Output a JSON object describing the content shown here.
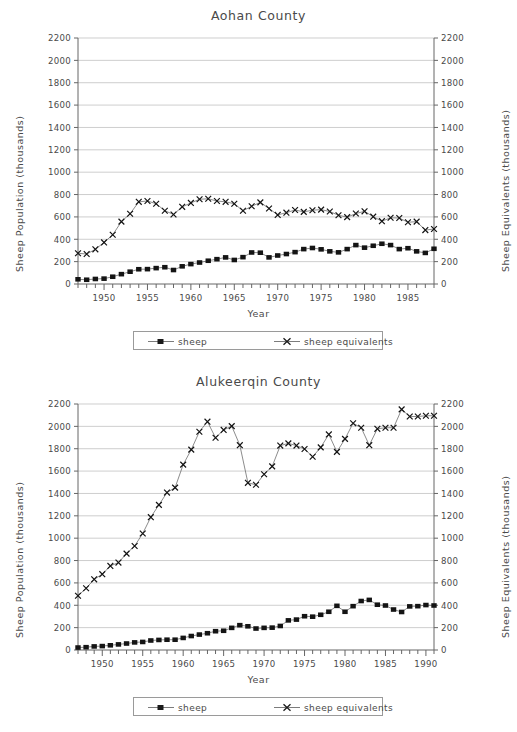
{
  "figure": {
    "xlabel": "Year",
    "ylabel_left": "Sheep Population (thousands)",
    "ylabel_right": "Sheep Equivalents (thousands)",
    "legend": [
      {
        "label": "sheep",
        "marker": "square",
        "color": "#1a1a1a"
      },
      {
        "label": "sheep equivalents",
        "marker": "cross",
        "color": "#1a1a1a"
      }
    ],
    "axis_color": "#666666",
    "grid_color": "#b9b9b9",
    "text_color": "#4a4a4a"
  },
  "chart_data": [
    {
      "type": "line",
      "title": "Aohan County",
      "xlabel": "Year",
      "ylabel": "Sheep Population (thousands)",
      "ylabel_right": "Sheep Equivalents (thousands)",
      "ylim": [
        0,
        2200
      ],
      "yticks": [
        0,
        200,
        400,
        600,
        800,
        1000,
        1200,
        1400,
        1600,
        1800,
        2000,
        2200
      ],
      "ytick_labels": [
        "0",
        "200",
        "400",
        "600",
        "800",
        "1000",
        "1200",
        "1400",
        "1600",
        "1800",
        "2000",
        "2200"
      ],
      "yticks_right": [
        0,
        200,
        400,
        600,
        800,
        1000,
        1200,
        1400,
        1600,
        1800,
        2000,
        2200
      ],
      "ytick_labels_right": [
        "0",
        "200",
        "400",
        "600",
        "800",
        "1000",
        "1200",
        "1400",
        "1600",
        "1800",
        "2000",
        "2200"
      ],
      "xlim": [
        1947,
        1988
      ],
      "xticks": [
        1950,
        1955,
        1960,
        1965,
        1970,
        1975,
        1980,
        1985
      ],
      "xtick_labels": [
        "1950",
        "1955",
        "1960",
        "1965",
        "1970",
        "1975",
        "1980",
        "1985"
      ],
      "x": [
        1947,
        1948,
        1949,
        1950,
        1951,
        1952,
        1953,
        1954,
        1955,
        1956,
        1957,
        1958,
        1959,
        1960,
        1961,
        1962,
        1963,
        1964,
        1965,
        1966,
        1967,
        1968,
        1969,
        1970,
        1971,
        1972,
        1973,
        1974,
        1975,
        1976,
        1977,
        1978,
        1979,
        1980,
        1981,
        1982,
        1983,
        1984,
        1985,
        1986,
        1987,
        1988
      ],
      "grid": true,
      "legend_position": "below",
      "series": [
        {
          "name": "sheep",
          "marker": "square",
          "values": [
            42,
            38,
            45,
            48,
            65,
            88,
            110,
            132,
            133,
            142,
            150,
            125,
            158,
            178,
            192,
            208,
            222,
            238,
            215,
            240,
            282,
            280,
            238,
            255,
            268,
            285,
            312,
            322,
            310,
            292,
            283,
            312,
            348,
            325,
            342,
            360,
            348,
            312,
            320,
            292,
            278,
            315
          ]
        },
        {
          "name": "sheep equivalents",
          "marker": "cross",
          "values": [
            275,
            268,
            310,
            372,
            440,
            558,
            628,
            735,
            742,
            718,
            655,
            622,
            690,
            725,
            758,
            762,
            742,
            735,
            718,
            655,
            695,
            730,
            675,
            618,
            638,
            662,
            645,
            660,
            665,
            648,
            615,
            598,
            630,
            650,
            602,
            562,
            592,
            590,
            552,
            558,
            482,
            492
          ]
        }
      ]
    },
    {
      "type": "line",
      "title": "Alukeerqin County",
      "xlabel": "Year",
      "ylabel": "Sheep Population (thousands)",
      "ylabel_right": "Sheep Equivalents (thousands)",
      "ylim": [
        0,
        2200
      ],
      "yticks": [
        0,
        200,
        400,
        600,
        800,
        1000,
        1200,
        1400,
        1600,
        1800,
        2000,
        2200
      ],
      "ytick_labels": [
        "0",
        "200",
        "400",
        "600",
        "800",
        "1000",
        "1200",
        "1400",
        "1600",
        "1800",
        "2000",
        "2200"
      ],
      "yticks_right": [
        0,
        200,
        400,
        600,
        800,
        1000,
        1200,
        1400,
        1600,
        1800,
        2000,
        2200
      ],
      "ytick_labels_right": [
        "0",
        "200",
        "400",
        "600",
        "800",
        "1000",
        "1200",
        "1400",
        "1600",
        "1800",
        "2000",
        "2200"
      ],
      "xlim": [
        1947,
        1991
      ],
      "xticks": [
        1950,
        1955,
        1960,
        1965,
        1970,
        1975,
        1980,
        1985,
        1990
      ],
      "xtick_labels": [
        "1950",
        "1955",
        "1960",
        "1965",
        "1970",
        "1975",
        "1980",
        "1985",
        "1990"
      ],
      "x": [
        1947,
        1948,
        1949,
        1950,
        1951,
        1952,
        1953,
        1954,
        1955,
        1956,
        1957,
        1958,
        1959,
        1960,
        1961,
        1962,
        1963,
        1964,
        1965,
        1966,
        1967,
        1968,
        1969,
        1970,
        1971,
        1972,
        1973,
        1974,
        1975,
        1976,
        1977,
        1978,
        1979,
        1980,
        1981,
        1982,
        1983,
        1984,
        1985,
        1986,
        1987,
        1988,
        1989,
        1990,
        1991
      ],
      "grid": true,
      "legend_position": "below",
      "series": [
        {
          "name": "sheep",
          "marker": "square",
          "values": [
            22,
            25,
            32,
            35,
            42,
            50,
            58,
            68,
            72,
            85,
            90,
            92,
            92,
            108,
            125,
            138,
            150,
            168,
            172,
            198,
            222,
            212,
            192,
            198,
            200,
            215,
            265,
            272,
            302,
            298,
            315,
            342,
            395,
            342,
            392,
            438,
            448,
            405,
            398,
            362,
            340,
            390,
            392,
            402,
            398
          ]
        },
        {
          "name": "sheep equivalents",
          "marker": "cross",
          "values": [
            485,
            552,
            632,
            678,
            752,
            782,
            862,
            930,
            1042,
            1188,
            1298,
            1408,
            1452,
            1658,
            1792,
            1952,
            2042,
            1898,
            1968,
            2002,
            1832,
            1495,
            1478,
            1572,
            1642,
            1828,
            1848,
            1828,
            1798,
            1728,
            1812,
            1928,
            1772,
            1888,
            2028,
            1988,
            1832,
            1978,
            1988,
            1988,
            2152,
            2088,
            2088,
            2095,
            2095
          ]
        }
      ]
    }
  ]
}
